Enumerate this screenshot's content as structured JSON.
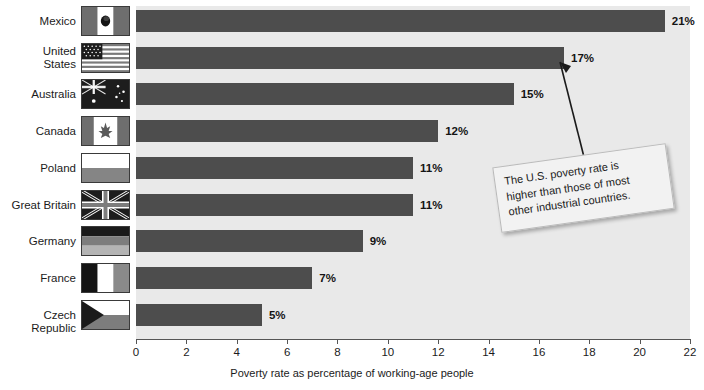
{
  "chart_data": {
    "type": "bar",
    "orientation": "horizontal",
    "title": "",
    "xlabel": "Poverty rate as percentage of working-age people",
    "ylabel": "",
    "xlim": [
      0,
      22
    ],
    "xticks": [
      0,
      2,
      4,
      6,
      8,
      10,
      12,
      14,
      16,
      18,
      20,
      22
    ],
    "grid": false,
    "legend": "none",
    "categories": [
      "Mexico",
      "United States",
      "Australia",
      "Canada",
      "Poland",
      "Great Britain",
      "Germany",
      "France",
      "Czech Republic"
    ],
    "values": [
      21,
      17,
      15,
      12,
      11,
      11,
      9,
      7,
      5
    ],
    "value_labels": [
      "21%",
      "17%",
      "15%",
      "12%",
      "11%",
      "11%",
      "9%",
      "7%",
      "5%"
    ],
    "bar_color": "#4d4d4d",
    "plot_background": "#e9e9e9",
    "annotations": [
      {
        "text": "The U.S. poverty rate is higher than those of most other industrial countries.",
        "points_to_category": "United States",
        "points_to_value": 17
      }
    ]
  },
  "rows": [
    {
      "label": "Mexico",
      "label_line1": "Mexico",
      "label_line2": "",
      "value": 21,
      "value_label": "21%",
      "flag": "flag-mexico"
    },
    {
      "label": "United States",
      "label_line1": "United",
      "label_line2": "States",
      "value": 17,
      "value_label": "17%",
      "flag": "flag-united-states"
    },
    {
      "label": "Australia",
      "label_line1": "Australia",
      "label_line2": "",
      "value": 15,
      "value_label": "15%",
      "flag": "flag-australia"
    },
    {
      "label": "Canada",
      "label_line1": "Canada",
      "label_line2": "",
      "value": 12,
      "value_label": "12%",
      "flag": "flag-canada"
    },
    {
      "label": "Poland",
      "label_line1": "Poland",
      "label_line2": "",
      "value": 11,
      "value_label": "11%",
      "flag": "flag-poland"
    },
    {
      "label": "Great Britain",
      "label_line1": "Great Britain",
      "label_line2": "",
      "value": 11,
      "value_label": "11%",
      "flag": "flag-great-britain"
    },
    {
      "label": "Germany",
      "label_line1": "Germany",
      "label_line2": "",
      "value": 9,
      "value_label": "9%",
      "flag": "flag-germany"
    },
    {
      "label": "France",
      "label_line1": "France",
      "label_line2": "",
      "value": 7,
      "value_label": "7%",
      "flag": "flag-france"
    },
    {
      "label": "Czech Republic",
      "label_line1": "Czech Republic",
      "label_line2": "",
      "value": 5,
      "value_label": "5%",
      "flag": "flag-czech-republic"
    }
  ],
  "axis": {
    "title": "Poverty rate as percentage of working-age people",
    "ticks": [
      "0",
      "2",
      "4",
      "6",
      "8",
      "10",
      "12",
      "14",
      "16",
      "18",
      "20",
      "22"
    ]
  },
  "callout": {
    "line1": "The U.S. poverty rate is",
    "line2": "higher than those of most",
    "line3": "other industrial countries."
  }
}
